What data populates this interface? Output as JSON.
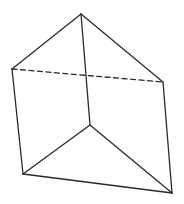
{
  "diagram": {
    "stroke_color": "#2a2a2a",
    "background": "#ffffff",
    "vertices": {
      "A": [
        81,
        14
      ],
      "B": [
        12,
        69
      ],
      "C": [
        163,
        82
      ],
      "D": [
        23,
        174
      ],
      "E": [
        90,
        125
      ],
      "F": [
        172,
        193
      ]
    },
    "edges": [
      {
        "from": "A",
        "to": "B",
        "style": "solid"
      },
      {
        "from": "A",
        "to": "C",
        "style": "solid"
      },
      {
        "from": "B",
        "to": "C",
        "style": "dashed"
      },
      {
        "from": "A",
        "to": "E",
        "style": "solid"
      },
      {
        "from": "B",
        "to": "D",
        "style": "solid"
      },
      {
        "from": "C",
        "to": "F",
        "style": "solid"
      },
      {
        "from": "D",
        "to": "E",
        "style": "solid"
      },
      {
        "from": "E",
        "to": "F",
        "style": "solid"
      },
      {
        "from": "D",
        "to": "F",
        "style": "solid"
      }
    ]
  }
}
